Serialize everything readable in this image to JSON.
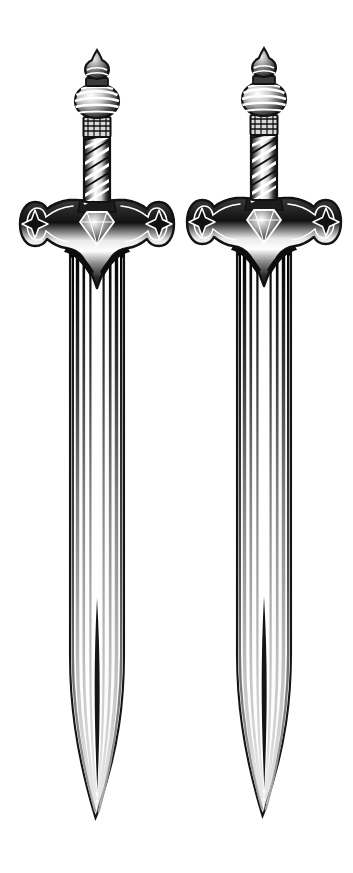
{
  "artwork": {
    "title": "Two Medieval Longswords",
    "subject": "sword-pair-illustration",
    "style": "black-and-white pen-and-ink line drawing with stipple shading",
    "background_color": "#ffffff",
    "ink_color": "#1a1a1a",
    "mid_tone_color": "#6e6e6e",
    "highlight_color": "#ffffff",
    "canvas": {
      "width": 353,
      "height": 873
    },
    "count": 2,
    "orientation": "vertical, points down"
  },
  "swords": [
    {
      "id": "sword-left",
      "label": "Left Sword",
      "center_x": 97,
      "top_y": 50,
      "tip_y": 820,
      "parts": {
        "finial": {
          "label": "Pommel Finial",
          "shape": "onion-spire",
          "top_y": 50,
          "bottom_y": 86,
          "width": 26
        },
        "pommel": {
          "label": "Bulbous Pommel",
          "shape": "banded-bulb",
          "top_y": 86,
          "bottom_y": 118,
          "width": 44,
          "bands": 5
        },
        "collar": {
          "label": "Hatched Collar",
          "shape": "rectangular-ferrule",
          "top_y": 118,
          "bottom_y": 136,
          "width": 26
        },
        "grip": {
          "label": "Spiral-Wrapped Grip",
          "shape": "spiral-wrap",
          "top_y": 136,
          "bottom_y": 200,
          "width": 26,
          "wraps": 8
        },
        "guard": {
          "label": "Crossguard",
          "shape": "flared-cross",
          "left_x": 20,
          "right_x": 174,
          "top_y": 198,
          "bottom_y": 250,
          "star_cutouts": 2
        },
        "gem": {
          "label": "Center Gem",
          "shape": "faceted-diamond",
          "center_y": 222,
          "width": 34
        },
        "blade": {
          "label": "Fullered Blade",
          "top_y": 243,
          "tip_y": 820,
          "left_x": 70,
          "right_x": 124,
          "fullers": 6,
          "taper_start_y": 660
        }
      }
    },
    {
      "id": "sword-right",
      "label": "Right Sword",
      "center_x": 264,
      "top_y": 50,
      "tip_y": 818,
      "parts": {
        "finial": {
          "label": "Pommel Finial",
          "shape": "onion-spire",
          "top_y": 50,
          "bottom_y": 86,
          "width": 26
        },
        "pommel": {
          "label": "Bulbous Pommel",
          "shape": "banded-bulb",
          "top_y": 86,
          "bottom_y": 118,
          "width": 44,
          "bands": 5
        },
        "collar": {
          "label": "Hatched Collar",
          "shape": "rectangular-ferrule",
          "top_y": 118,
          "bottom_y": 136,
          "width": 26
        },
        "grip": {
          "label": "Spiral-Wrapped Grip",
          "shape": "spiral-wrap",
          "top_y": 136,
          "bottom_y": 200,
          "width": 26,
          "wraps": 8
        },
        "guard": {
          "label": "Crossguard",
          "shape": "flared-cross",
          "left_x": 187,
          "right_x": 341,
          "top_y": 198,
          "bottom_y": 250,
          "star_cutouts": 2
        },
        "gem": {
          "label": "Center Gem",
          "shape": "faceted-diamond",
          "center_y": 222,
          "width": 34
        },
        "blade": {
          "label": "Fullered Blade",
          "top_y": 243,
          "tip_y": 818,
          "left_x": 237,
          "right_x": 291,
          "fullers": 6,
          "taper_start_y": 658
        }
      }
    }
  ]
}
